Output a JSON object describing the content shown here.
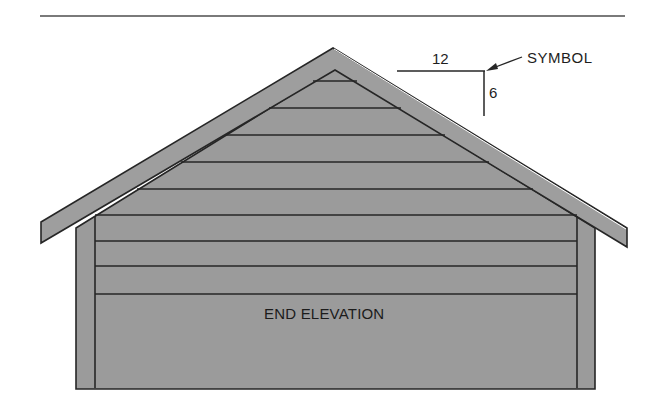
{
  "figure": {
    "drawing_label": "END ELEVATION",
    "slope_symbol": {
      "run": "12",
      "rise": "6",
      "callout": "SYMBOL"
    }
  },
  "colors": {
    "fill": "#9b9b9b",
    "line": "#262626",
    "background": "#ffffff",
    "rule": "#7a7a7a"
  },
  "siding": {
    "courses_in_gable": 4,
    "courses_in_wall": 5
  }
}
